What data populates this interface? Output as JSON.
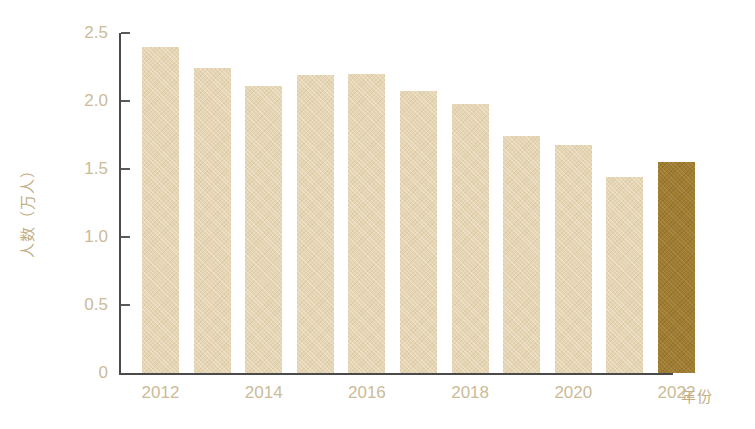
{
  "chart_data": {
    "type": "bar",
    "title": "",
    "subtitle": "",
    "xlabel": "年份",
    "ylabel": "人数（万人）",
    "categories": [
      "2012",
      "2013",
      "2014",
      "2015",
      "2016",
      "2017",
      "2018",
      "2019",
      "2020",
      "2021",
      "2022"
    ],
    "values": [
      2.4,
      2.24,
      2.11,
      2.19,
      2.2,
      2.07,
      1.98,
      1.74,
      1.68,
      1.44,
      1.55
    ],
    "series": [
      {
        "name": "人数（万人）",
        "values": [
          2.4,
          2.24,
          2.11,
          2.19,
          2.2,
          2.07,
          1.98,
          1.74,
          1.68,
          1.44,
          1.55
        ]
      }
    ],
    "ylim": [
      0,
      2.5
    ],
    "yticks": [
      "0",
      "0.5",
      "1.0",
      "1.5",
      "2.0",
      "2.5"
    ],
    "ytick_values": [
      0,
      0.5,
      1.0,
      1.5,
      2.0,
      2.5
    ],
    "xticks_visible": [
      "2012",
      "2014",
      "2016",
      "2018",
      "2020",
      "2022"
    ],
    "grid": false,
    "legend": "none",
    "highlighted_category": "2022",
    "colors": {
      "bar": "#e5d5b2",
      "bar_highlight": "#a07c30",
      "axis": "#4a4a4a",
      "tick_text": "#cbbb98",
      "axis_label_text": "#c2ae86",
      "background": "#ffffff"
    }
  }
}
